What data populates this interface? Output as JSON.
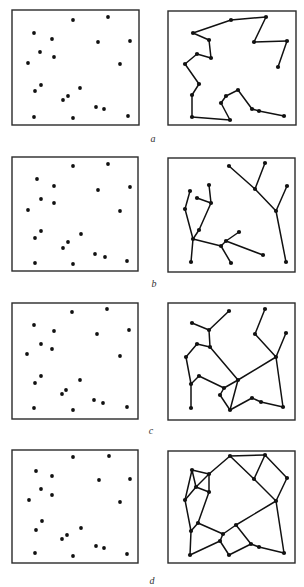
{
  "panels": [
    {
      "label": "a",
      "label_pos": [
        153,
        140
      ],
      "left_box": [
        12,
        10,
        127,
        115
      ],
      "right_box": [
        168,
        11,
        128,
        114
      ],
      "points": [
        [
          73,
          20
        ],
        [
          108,
          17
        ],
        [
          34,
          33
        ],
        [
          52,
          39
        ],
        [
          98,
          42
        ],
        [
          130,
          41
        ],
        [
          40,
          52
        ],
        [
          54,
          57
        ],
        [
          28,
          63
        ],
        [
          120,
          64
        ],
        [
          41,
          85
        ],
        [
          35,
          91
        ],
        [
          80,
          88
        ],
        [
          68,
          96
        ],
        [
          63,
          100
        ],
        [
          96,
          107
        ],
        [
          104,
          109
        ],
        [
          34,
          117
        ],
        [
          73,
          118
        ],
        [
          128,
          116
        ]
      ],
      "nodes": [
        [
          278,
          67
        ],
        [
          287,
          41
        ],
        [
          254,
          42
        ],
        [
          266,
          17
        ],
        [
          231,
          20
        ],
        [
          193,
          33
        ],
        [
          209,
          40
        ],
        [
          211,
          58
        ],
        [
          197,
          54
        ],
        [
          185,
          64
        ],
        [
          199,
          84
        ],
        [
          192,
          95
        ],
        [
          192,
          117
        ],
        [
          230,
          120
        ],
        [
          221,
          103
        ],
        [
          226,
          96
        ],
        [
          238,
          90
        ],
        [
          252,
          109
        ],
        [
          259,
          111
        ],
        [
          284,
          116
        ]
      ],
      "edges": [
        [
          0,
          1
        ],
        [
          1,
          2
        ],
        [
          2,
          3
        ],
        [
          3,
          4
        ],
        [
          4,
          5
        ],
        [
          5,
          6
        ],
        [
          6,
          7
        ],
        [
          7,
          8
        ],
        [
          8,
          9
        ],
        [
          9,
          10
        ],
        [
          10,
          11
        ],
        [
          11,
          12
        ],
        [
          12,
          13
        ],
        [
          13,
          14
        ],
        [
          14,
          15
        ],
        [
          15,
          16
        ],
        [
          16,
          17
        ],
        [
          17,
          18
        ],
        [
          18,
          19
        ]
      ]
    },
    {
      "label": "b",
      "label_pos": [
        154,
        285
      ],
      "left_box": [
        12,
        157,
        126,
        114
      ],
      "right_box": [
        168,
        158,
        127,
        114
      ],
      "points": [
        [
          73,
          166
        ],
        [
          108,
          164
        ],
        [
          37,
          179
        ],
        [
          54,
          186
        ],
        [
          98,
          190
        ],
        [
          130,
          187
        ],
        [
          41,
          199
        ],
        [
          54,
          203
        ],
        [
          28,
          210
        ],
        [
          120,
          211
        ],
        [
          41,
          231
        ],
        [
          35,
          238
        ],
        [
          81,
          234
        ],
        [
          68,
          242
        ],
        [
          63,
          248
        ],
        [
          95,
          254
        ],
        [
          105,
          257
        ],
        [
          35,
          263
        ],
        [
          73,
          264
        ],
        [
          127,
          261
        ]
      ],
      "nodes": [
        [
          229,
          166
        ],
        [
          255,
          189
        ],
        [
          265,
          163
        ],
        [
          276,
          211
        ],
        [
          287,
          186
        ],
        [
          286,
          262
        ],
        [
          190,
          191
        ],
        [
          185,
          209
        ],
        [
          193,
          239
        ],
        [
          191,
          262
        ],
        [
          199,
          230
        ],
        [
          211,
          203
        ],
        [
          209,
          185
        ],
        [
          197,
          198
        ],
        [
          221,
          246
        ],
        [
          226,
          241
        ],
        [
          239,
          232
        ],
        [
          263,
          255
        ],
        [
          231,
          263
        ]
      ],
      "edges": [
        [
          0,
          1
        ],
        [
          1,
          2
        ],
        [
          1,
          3
        ],
        [
          3,
          4
        ],
        [
          3,
          5
        ],
        [
          6,
          7
        ],
        [
          7,
          8
        ],
        [
          8,
          9
        ],
        [
          8,
          10
        ],
        [
          10,
          11
        ],
        [
          11,
          12
        ],
        [
          11,
          13
        ],
        [
          8,
          14
        ],
        [
          14,
          15
        ],
        [
          15,
          16
        ],
        [
          15,
          17
        ],
        [
          14,
          18
        ]
      ]
    },
    {
      "label": "c",
      "label_pos": [
        151,
        432
      ],
      "left_box": [
        12,
        303,
        126,
        116
      ],
      "right_box": [
        168,
        303,
        127,
        117
      ],
      "points": [
        [
          72,
          312
        ],
        [
          107,
          309
        ],
        [
          34,
          325
        ],
        [
          54,
          331
        ],
        [
          97,
          334
        ],
        [
          129,
          330
        ],
        [
          41,
          344
        ],
        [
          52,
          349
        ],
        [
          27,
          354
        ],
        [
          120,
          356
        ],
        [
          41,
          376
        ],
        [
          35,
          383
        ],
        [
          80,
          380
        ],
        [
          66,
          390
        ],
        [
          62,
          394
        ],
        [
          94,
          400
        ],
        [
          103,
          403
        ],
        [
          34,
          408
        ],
        [
          73,
          410
        ],
        [
          127,
          407
        ]
      ],
      "nodes": [
        [
          229,
          311
        ],
        [
          209,
          330
        ],
        [
          192,
          323
        ],
        [
          210,
          347
        ],
        [
          197,
          344
        ],
        [
          186,
          357
        ],
        [
          191,
          384
        ],
        [
          191,
          408
        ],
        [
          238,
          380
        ],
        [
          265,
          309
        ],
        [
          255,
          334
        ],
        [
          276,
          357
        ],
        [
          286,
          333
        ],
        [
          283,
          407
        ],
        [
          199,
          376
        ],
        [
          224,
          388
        ],
        [
          220,
          395
        ],
        [
          230,
          410
        ],
        [
          252,
          398
        ],
        [
          261,
          402
        ]
      ],
      "edges": [
        [
          0,
          1
        ],
        [
          1,
          2
        ],
        [
          1,
          3
        ],
        [
          3,
          4
        ],
        [
          4,
          5
        ],
        [
          5,
          6
        ],
        [
          6,
          7
        ],
        [
          3,
          8
        ],
        [
          9,
          10
        ],
        [
          10,
          11
        ],
        [
          11,
          12
        ],
        [
          11,
          8
        ],
        [
          11,
          13
        ],
        [
          6,
          14
        ],
        [
          14,
          15
        ],
        [
          15,
          8
        ],
        [
          15,
          16
        ],
        [
          16,
          17
        ],
        [
          17,
          8
        ],
        [
          17,
          18
        ],
        [
          18,
          19
        ],
        [
          19,
          13
        ]
      ]
    },
    {
      "label": "d",
      "label_pos": [
        152,
        582
      ],
      "left_box": [
        12,
        450,
        126,
        113
      ],
      "right_box": [
        168,
        451,
        127,
        112
      ],
      "points": [
        [
          73,
          457
        ],
        [
          109,
          456
        ],
        [
          36,
          471
        ],
        [
          52,
          476
        ],
        [
          99,
          480
        ],
        [
          130,
          479
        ],
        [
          41,
          489
        ],
        [
          52,
          495
        ],
        [
          29,
          500
        ],
        [
          120,
          502
        ],
        [
          42,
          521
        ],
        [
          36,
          530
        ],
        [
          81,
          528
        ],
        [
          67,
          535
        ],
        [
          62,
          539
        ],
        [
          96,
          546
        ],
        [
          104,
          548
        ],
        [
          35,
          553
        ],
        [
          73,
          556
        ],
        [
          127,
          554
        ]
      ],
      "nodes": [
        [
          230,
          456
        ],
        [
          265,
          455
        ],
        [
          192,
          470
        ],
        [
          209,
          474
        ],
        [
          254,
          479
        ],
        [
          287,
          478
        ],
        [
          196,
          487
        ],
        [
          209,
          492
        ],
        [
          185,
          500
        ],
        [
          276,
          501
        ],
        [
          198,
          523
        ],
        [
          191,
          531
        ],
        [
          236,
          525
        ],
        [
          223,
          534
        ],
        [
          220,
          541
        ],
        [
          251,
          544
        ],
        [
          259,
          547
        ],
        [
          190,
          555
        ],
        [
          229,
          555
        ],
        [
          284,
          553
        ]
      ],
      "edges": [
        [
          0,
          1
        ],
        [
          0,
          3
        ],
        [
          0,
          4
        ],
        [
          4,
          9
        ],
        [
          1,
          4
        ],
        [
          1,
          5
        ],
        [
          5,
          9
        ],
        [
          2,
          3
        ],
        [
          2,
          6
        ],
        [
          2,
          8
        ],
        [
          6,
          3
        ],
        [
          6,
          7
        ],
        [
          6,
          8
        ],
        [
          3,
          7
        ],
        [
          7,
          10
        ],
        [
          8,
          11
        ],
        [
          10,
          11
        ],
        [
          10,
          13
        ],
        [
          9,
          12
        ],
        [
          12,
          13
        ],
        [
          13,
          14
        ],
        [
          11,
          17
        ],
        [
          17,
          14
        ],
        [
          14,
          18
        ],
        [
          12,
          15
        ],
        [
          18,
          15
        ],
        [
          15,
          16
        ],
        [
          16,
          19
        ],
        [
          9,
          19
        ]
      ]
    }
  ]
}
